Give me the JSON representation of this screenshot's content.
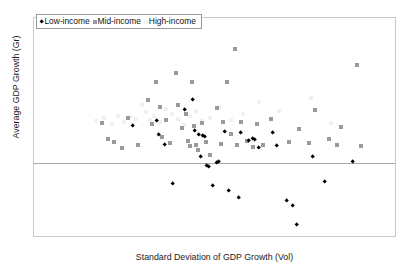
{
  "chart_data": {
    "type": "scatter",
    "title": "",
    "xlabel": "Standard Deviation of GDP Growth (Vol)",
    "ylabel": "Average GDP Growth (Gr)",
    "xlim": [
      0,
      9
    ],
    "ylim": [
      -4,
      8
    ],
    "xticks": [
      0,
      1,
      2,
      3,
      4,
      5,
      6,
      7,
      8,
      9
    ],
    "yticks": [
      -4,
      -2,
      0,
      2,
      4,
      6,
      8
    ],
    "grid": false,
    "zero_line": 0,
    "legend_position": "top-left",
    "series": [
      {
        "name": "Low-income",
        "marker": "diamond",
        "color": "#000000",
        "points": [
          [
            2.45,
            2.05
          ],
          [
            3.05,
            2.35
          ],
          [
            3.1,
            1.55
          ],
          [
            3.25,
            1.0
          ],
          [
            3.45,
            -1.1
          ],
          [
            3.75,
            2.95
          ],
          [
            3.95,
            3.5
          ],
          [
            4.0,
            1.8
          ],
          [
            4.1,
            1.6
          ],
          [
            4.15,
            0.35
          ],
          [
            4.2,
            1.5
          ],
          [
            4.25,
            1.45
          ],
          [
            4.3,
            -0.15
          ],
          [
            4.35,
            -0.2
          ],
          [
            4.45,
            -1.25
          ],
          [
            4.55,
            0.05
          ],
          [
            4.6,
            0.1
          ],
          [
            4.75,
            1.75
          ],
          [
            4.85,
            -1.5
          ],
          [
            5.1,
            -1.9
          ],
          [
            5.15,
            1.7
          ],
          [
            5.35,
            1.25
          ],
          [
            5.45,
            1.35
          ],
          [
            5.5,
            1.3
          ],
          [
            5.6,
            0.85
          ],
          [
            5.95,
            1.7
          ],
          [
            6.05,
            0.95
          ],
          [
            6.3,
            -2.05
          ],
          [
            6.45,
            -2.35
          ],
          [
            6.55,
            -3.35
          ],
          [
            6.95,
            0.35
          ],
          [
            7.25,
            -1.0
          ],
          [
            7.95,
            0.1
          ]
        ]
      },
      {
        "name": "Mid-income",
        "marker": "square",
        "color": "#9a9a9a",
        "points": [
          [
            1.7,
            2.2
          ],
          [
            1.85,
            1.35
          ],
          [
            2.0,
            1.15
          ],
          [
            2.2,
            0.85
          ],
          [
            2.35,
            2.5
          ],
          [
            2.6,
            1.0
          ],
          [
            2.85,
            3.5
          ],
          [
            2.95,
            2.15
          ],
          [
            3.05,
            4.45
          ],
          [
            3.15,
            3.1
          ],
          [
            3.2,
            1.45
          ],
          [
            3.3,
            2.4
          ],
          [
            3.4,
            1.1
          ],
          [
            3.55,
            5.0
          ],
          [
            3.6,
            3.2
          ],
          [
            3.7,
            1.95
          ],
          [
            3.8,
            2.7
          ],
          [
            3.85,
            1.25
          ],
          [
            3.9,
            0.95
          ],
          [
            3.95,
            4.45
          ],
          [
            4.0,
            2.05
          ],
          [
            4.05,
            1.0
          ],
          [
            4.1,
            0.75
          ],
          [
            4.2,
            2.2
          ],
          [
            4.3,
            1.15
          ],
          [
            4.4,
            0.45
          ],
          [
            4.55,
            3.05
          ],
          [
            4.65,
            1.05
          ],
          [
            4.7,
            2.3
          ],
          [
            4.8,
            4.45
          ],
          [
            4.9,
            1.6
          ],
          [
            5.0,
            6.3
          ],
          [
            5.05,
            1.0
          ],
          [
            5.15,
            2.25
          ],
          [
            5.3,
            1.25
          ],
          [
            5.45,
            0.9
          ],
          [
            5.55,
            2.15
          ],
          [
            5.7,
            1.0
          ],
          [
            5.9,
            2.45
          ],
          [
            6.35,
            1.15
          ],
          [
            6.6,
            1.9
          ],
          [
            6.85,
            1.1
          ],
          [
            7.0,
            2.95
          ],
          [
            7.35,
            1.35
          ],
          [
            7.55,
            1.0
          ],
          [
            7.65,
            2.0
          ],
          [
            8.05,
            5.4
          ],
          [
            8.15,
            0.95
          ]
        ]
      },
      {
        "name": "High-income",
        "marker": "square",
        "color": "#f0f0f0",
        "points": [
          [
            1.55,
            2.35
          ],
          [
            1.75,
            2.5
          ],
          [
            1.95,
            2.15
          ],
          [
            2.1,
            2.6
          ],
          [
            2.25,
            2.3
          ],
          [
            2.4,
            2.55
          ],
          [
            2.55,
            2.45
          ],
          [
            2.7,
            3.2
          ],
          [
            2.8,
            2.85
          ],
          [
            2.9,
            2.4
          ],
          [
            3.0,
            2.6
          ],
          [
            3.15,
            2.25
          ],
          [
            3.3,
            3.0
          ],
          [
            3.45,
            2.7
          ],
          [
            3.6,
            2.45
          ],
          [
            3.75,
            2.1
          ],
          [
            3.9,
            2.6
          ],
          [
            4.05,
            2.9
          ],
          [
            4.2,
            2.35
          ],
          [
            4.4,
            2.5
          ],
          [
            4.6,
            3.1
          ],
          [
            4.9,
            2.4
          ],
          [
            5.2,
            2.7
          ],
          [
            5.6,
            3.35
          ],
          [
            6.1,
            2.9
          ],
          [
            6.9,
            3.6
          ],
          [
            7.4,
            2.2
          ]
        ]
      }
    ]
  },
  "legend": {
    "items": [
      {
        "label": "Low-income",
        "marker_class": "low"
      },
      {
        "label": "Mid-income",
        "marker_class": "mid"
      },
      {
        "label": "High-income",
        "marker_class": "high"
      }
    ]
  }
}
